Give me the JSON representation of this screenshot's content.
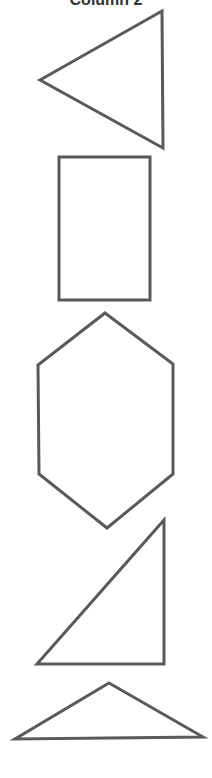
{
  "title": "Column 2",
  "stroke_color": "#5a5a5a",
  "stroke_width": 3,
  "shapes": [
    {
      "name": "left-pointing-triangle",
      "points": "40,80 162,11 163,148"
    },
    {
      "name": "rectangle",
      "points": "59,157 150,157 150,300 59,300"
    },
    {
      "name": "hexagon",
      "points": "105,313 173,364 173,474 107,528 39,474 38,365"
    },
    {
      "name": "right-triangle",
      "points": "164,520 164,664 37,664"
    },
    {
      "name": "obtuse-triangle",
      "points": "109,683 203,737 15,739"
    }
  ]
}
